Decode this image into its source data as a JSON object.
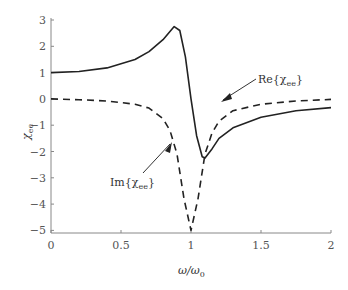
{
  "chart_data": {
    "type": "line",
    "title": "",
    "xlabel": "ω/ω0",
    "ylabel": "χee",
    "xlim": [
      0,
      2
    ],
    "ylim": [
      -5.3,
      3
    ],
    "grid": false,
    "x_ticks": [
      "0",
      "0.5",
      "1",
      "1.5",
      "2"
    ],
    "y_ticks": [
      "3",
      "2",
      "1",
      "0",
      "−1",
      "−2",
      "−3",
      "−4",
      "−5"
    ],
    "series": [
      {
        "name": "Re{χee}",
        "style": "solid",
        "x": [
          0,
          0.2,
          0.4,
          0.6,
          0.7,
          0.8,
          0.88,
          0.92,
          0.96,
          1.0,
          1.04,
          1.08,
          1.1,
          1.15,
          1.2,
          1.3,
          1.5,
          1.75,
          2.0
        ],
        "y": [
          1.0,
          1.04,
          1.18,
          1.5,
          1.8,
          2.25,
          2.75,
          2.6,
          1.6,
          0.0,
          -1.4,
          -2.2,
          -2.25,
          -1.9,
          -1.5,
          -1.1,
          -0.7,
          -0.45,
          -0.33
        ]
      },
      {
        "name": "Im{χee}",
        "style": "dashed",
        "x": [
          0,
          0.2,
          0.4,
          0.6,
          0.7,
          0.8,
          0.85,
          0.9,
          0.95,
          1.0,
          1.05,
          1.1,
          1.15,
          1.2,
          1.3,
          1.5,
          1.75,
          2.0
        ],
        "y": [
          0.0,
          -0.03,
          -0.08,
          -0.2,
          -0.35,
          -0.75,
          -1.2,
          -2.1,
          -3.8,
          -5.0,
          -3.8,
          -2.1,
          -1.3,
          -0.85,
          -0.45,
          -0.2,
          -0.08,
          -0.02
        ]
      }
    ],
    "annotations": [
      {
        "text": "Re{χee}",
        "arrow_to": [
          0.97,
          1.0
        ]
      },
      {
        "text": "Im{χee}",
        "arrow_to": [
          0.84,
          -1.1
        ]
      }
    ]
  },
  "labels": {
    "xlabel": "ω/ω",
    "xlabel_sub": "0",
    "ylabel": "χ",
    "ylabel_sub": "ee",
    "re_prefix": "Re{χ",
    "re_sub": "ee",
    "re_suffix": "}",
    "im_prefix": "Im{χ",
    "im_sub": "ee",
    "im_suffix": "}"
  }
}
